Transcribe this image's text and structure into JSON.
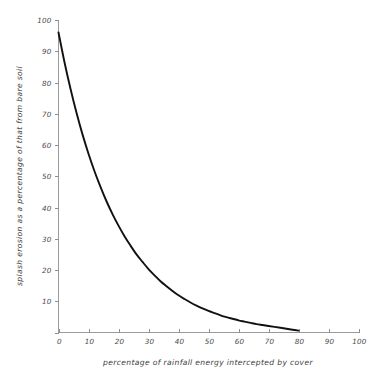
{
  "chart_data": {
    "type": "line",
    "title": "",
    "subtitle": "",
    "xlabel": "percentage of rainfall energy intercepted by cover",
    "ylabel": "splash erosion as a percentage of that from bare soil",
    "xlim": [
      0,
      100
    ],
    "ylim": [
      0,
      100
    ],
    "grid": false,
    "legend": null,
    "legend_position": "none",
    "xticks": [
      0,
      10,
      20,
      30,
      40,
      50,
      60,
      70,
      80,
      90,
      100
    ],
    "xticklabels": [
      "0",
      "10",
      "20",
      "30",
      "40",
      "50",
      "60",
      "70",
      "80",
      "90",
      "100"
    ],
    "yticks": [
      0,
      10,
      20,
      30,
      40,
      50,
      60,
      70,
      80,
      90,
      100
    ],
    "yticklabels": [
      "0",
      "10",
      "20",
      "30",
      "40",
      "50",
      "60",
      "70",
      "80",
      "90",
      "100"
    ],
    "annotations": [],
    "series": [
      {
        "name": "splash erosion decay",
        "color": "#111111",
        "x": [
          0,
          2,
          4,
          6,
          8,
          10,
          12,
          14,
          16,
          18,
          20,
          22,
          24,
          26,
          28,
          30,
          32,
          34,
          36,
          38,
          40,
          42,
          44,
          46,
          48,
          50,
          52,
          54,
          56,
          58,
          60,
          62,
          64,
          66,
          68,
          70,
          72,
          74,
          76,
          78,
          80
        ],
        "y": [
          96.0,
          86.5,
          78.0,
          70.3,
          63.4,
          57.2,
          51.6,
          46.6,
          42.0,
          37.9,
          34.2,
          30.8,
          27.8,
          25.0,
          22.6,
          20.3,
          18.3,
          16.4,
          14.8,
          13.3,
          11.9,
          10.7,
          9.6,
          8.6,
          7.7,
          6.9,
          6.2,
          5.5,
          4.9,
          4.4,
          3.9,
          3.5,
          3.1,
          2.7,
          2.4,
          2.1,
          1.8,
          1.5,
          1.2,
          0.9,
          0.6
        ]
      }
    ]
  },
  "axes": {
    "x_title": "percentage of rainfall energy intercepted by cover",
    "y_title": "splash erosion as a percentage of that from bare soil",
    "axis_color": "#9a9a9a",
    "curve_color": "#111111"
  }
}
